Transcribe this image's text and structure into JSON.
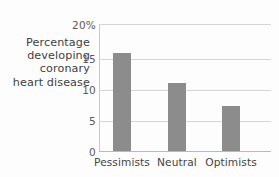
{
  "chart_data": {
    "type": "bar",
    "title": "",
    "xlabel": "",
    "ylabel": "Percentage developing coronary heart disease",
    "ylabel_lines": [
      "Percentage",
      "developing",
      "coronary",
      "heart disease"
    ],
    "categories": [
      "Pessimists",
      "Neutral",
      "Optimists"
    ],
    "values": [
      17.2,
      11.9,
      8.0
    ],
    "ylim": [
      0,
      22.5
    ],
    "yticks": [
      0,
      5,
      10,
      15,
      20
    ],
    "ytick_labels": [
      "0",
      "5",
      "10",
      "15",
      "20%"
    ],
    "grid": true,
    "legend": "none",
    "bar_color": "#8c8c8c",
    "axis_color": "#c9c9c9",
    "gridline_color": "#d5d5d5",
    "background_color": "#fdfdfd",
    "text_color": "#444444"
  }
}
